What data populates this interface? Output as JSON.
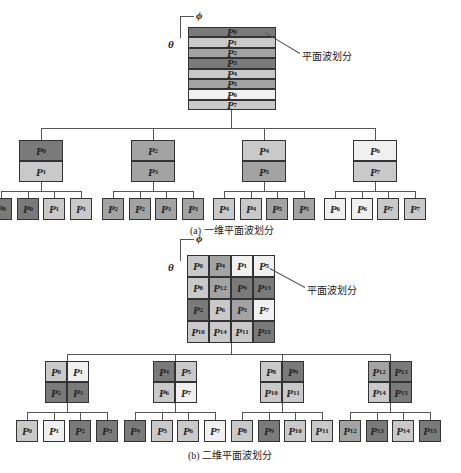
{
  "colors": {
    "dark": "#7a7a7a",
    "mid": "#a3a3a3",
    "light": "#c9c9c9",
    "pale": "#f0f0f0"
  },
  "axis": {
    "phi": "ϕ",
    "theta": "θ"
  },
  "part_a": {
    "caption": "(a) 一维平面波划分",
    "callout": "平面波划分",
    "stack": [
      {
        "label": "P",
        "sub": "0",
        "c": "dark"
      },
      {
        "label": "P",
        "sub": "1",
        "c": "light"
      },
      {
        "label": "P",
        "sub": "2",
        "c": "mid"
      },
      {
        "label": "P",
        "sub": "3",
        "c": "dark"
      },
      {
        "label": "P",
        "sub": "4",
        "c": "light"
      },
      {
        "label": "P",
        "sub": "5",
        "c": "mid"
      },
      {
        "label": "P",
        "sub": "6",
        "c": "pale"
      },
      {
        "label": "P",
        "sub": "7",
        "c": "light"
      }
    ],
    "groups": [
      {
        "cells": [
          {
            "s": "0",
            "c": "dark"
          },
          {
            "s": "1",
            "c": "light"
          }
        ],
        "leaves": [
          {
            "s": "0",
            "c": "dark"
          },
          {
            "s": "0",
            "c": "dark"
          },
          {
            "s": "1",
            "c": "light"
          },
          {
            "s": "1",
            "c": "light"
          }
        ]
      },
      {
        "cells": [
          {
            "s": "2",
            "c": "mid"
          },
          {
            "s": "3",
            "c": "mid"
          }
        ],
        "leaves": [
          {
            "s": "2",
            "c": "mid"
          },
          {
            "s": "2",
            "c": "mid"
          },
          {
            "s": "3",
            "c": "mid"
          },
          {
            "s": "3",
            "c": "mid"
          }
        ]
      },
      {
        "cells": [
          {
            "s": "4",
            "c": "light"
          },
          {
            "s": "5",
            "c": "mid"
          }
        ],
        "leaves": [
          {
            "s": "4",
            "c": "light"
          },
          {
            "s": "4",
            "c": "light"
          },
          {
            "s": "5",
            "c": "mid"
          },
          {
            "s": "5",
            "c": "mid"
          }
        ]
      },
      {
        "cells": [
          {
            "s": "6",
            "c": "pale"
          },
          {
            "s": "7",
            "c": "light"
          }
        ],
        "leaves": [
          {
            "s": "6",
            "c": "pale"
          },
          {
            "s": "6",
            "c": "pale"
          },
          {
            "s": "7",
            "c": "light"
          },
          {
            "s": "7",
            "c": "light"
          }
        ]
      }
    ]
  },
  "part_b": {
    "caption": "(b) 二维平面波划分",
    "callout": "平面波划分",
    "grid": [
      [
        {
          "s": "0",
          "c": "light"
        },
        {
          "s": "4",
          "c": "mid"
        },
        {
          "s": "1",
          "c": "pale"
        },
        {
          "s": "5",
          "c": "pale"
        }
      ],
      [
        {
          "s": "8",
          "c": "light"
        },
        {
          "s": "12",
          "c": "mid"
        },
        {
          "s": "9",
          "c": "dark"
        },
        {
          "s": "13",
          "c": "dark"
        }
      ],
      [
        {
          "s": "2",
          "c": "dark"
        },
        {
          "s": "6",
          "c": "light"
        },
        {
          "s": "3",
          "c": "mid"
        },
        {
          "s": "7",
          "c": "pale"
        }
      ],
      [
        {
          "s": "10",
          "c": "light"
        },
        {
          "s": "14",
          "c": "light"
        },
        {
          "s": "11",
          "c": "light"
        },
        {
          "s": "15",
          "c": "dark"
        }
      ]
    ],
    "groups": [
      {
        "cells": [
          {
            "s": "0",
            "c": "light"
          },
          {
            "s": "1",
            "c": "pale"
          },
          {
            "s": "2",
            "c": "dark"
          },
          {
            "s": "3",
            "c": "dark"
          }
        ]
      },
      {
        "cells": [
          {
            "s": "4",
            "c": "dark"
          },
          {
            "s": "5",
            "c": "light"
          },
          {
            "s": "6",
            "c": "light"
          },
          {
            "s": "7",
            "c": "pale"
          }
        ]
      },
      {
        "cells": [
          {
            "s": "8",
            "c": "light"
          },
          {
            "s": "9",
            "c": "dark"
          },
          {
            "s": "10",
            "c": "light"
          },
          {
            "s": "11",
            "c": "light"
          }
        ]
      },
      {
        "cells": [
          {
            "s": "12",
            "c": "mid"
          },
          {
            "s": "13",
            "c": "dark"
          },
          {
            "s": "14",
            "c": "light"
          },
          {
            "s": "15",
            "c": "dark"
          }
        ]
      }
    ]
  }
}
